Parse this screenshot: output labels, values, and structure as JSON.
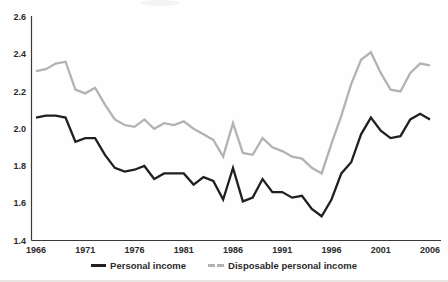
{
  "figure": {
    "background": "#fefefe",
    "axis_color": "#3a3a3a",
    "legend": [
      {
        "label": "Personal income",
        "color": "#231f20",
        "swatch": "solid"
      },
      {
        "label": "Disposable personal income",
        "color": "#b3b3b3",
        "swatch": "dashed"
      }
    ]
  },
  "chart_data": {
    "type": "line",
    "title": "",
    "xlabel": "",
    "ylabel": "",
    "x": [
      1966,
      1967,
      1968,
      1969,
      1970,
      1971,
      1972,
      1973,
      1974,
      1975,
      1976,
      1977,
      1978,
      1979,
      1980,
      1981,
      1982,
      1983,
      1984,
      1985,
      1986,
      1987,
      1988,
      1989,
      1990,
      1991,
      1992,
      1993,
      1994,
      1995,
      1996,
      1997,
      1998,
      1999,
      2000,
      2001,
      2002,
      2003,
      2004,
      2005,
      2006
    ],
    "series": [
      {
        "name": "Personal income",
        "color": "#231f20",
        "values": [
          2.06,
          2.07,
          2.07,
          2.06,
          1.93,
          1.95,
          1.95,
          1.86,
          1.79,
          1.77,
          1.78,
          1.8,
          1.73,
          1.76,
          1.76,
          1.76,
          1.7,
          1.74,
          1.72,
          1.62,
          1.79,
          1.61,
          1.63,
          1.73,
          1.66,
          1.66,
          1.63,
          1.64,
          1.57,
          1.53,
          1.62,
          1.76,
          1.82,
          1.97,
          2.06,
          1.99,
          1.95,
          1.96,
          2.05,
          2.08,
          2.05
        ]
      },
      {
        "name": "Disposable personal income",
        "color": "#b3b3b3",
        "values": [
          2.31,
          2.32,
          2.35,
          2.36,
          2.21,
          2.19,
          2.22,
          2.13,
          2.05,
          2.02,
          2.01,
          2.05,
          2.0,
          2.03,
          2.02,
          2.04,
          2.0,
          1.97,
          1.94,
          1.85,
          2.03,
          1.87,
          1.86,
          1.95,
          1.9,
          1.88,
          1.85,
          1.84,
          1.79,
          1.76,
          1.92,
          2.07,
          2.24,
          2.37,
          2.41,
          2.3,
          2.21,
          2.2,
          2.3,
          2.35,
          2.34
        ]
      }
    ],
    "xlim": [
      1966,
      2006
    ],
    "ylim": [
      1.4,
      2.6
    ],
    "yticks": [
      1.4,
      1.6,
      1.8,
      2.0,
      2.2,
      2.4,
      2.6
    ],
    "xticks": [
      1966,
      1971,
      1976,
      1981,
      1986,
      1991,
      1996,
      2001,
      2006
    ],
    "grid": false,
    "legend_position": "bottom"
  }
}
